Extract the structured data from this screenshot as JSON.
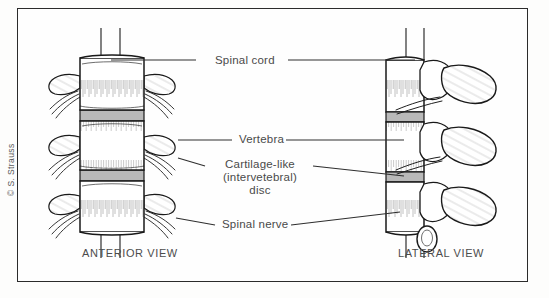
{
  "figure": {
    "credit": "© S. Strauss",
    "frame_color": "#2b2b2b",
    "background_color": "#fefefe",
    "bone_fill": "#ffffff",
    "bone_outline": "#1a1a1a",
    "disc_fill": "#b9b9b9",
    "label_color": "#4a4a4a",
    "leader_color": "#2e2e2e"
  },
  "labels": {
    "spinal_cord": "Spinal cord",
    "vertebra": "Vertebra",
    "disc_line1": "Cartilage-like",
    "disc_line2": "(intervetebral)",
    "disc_line3": "disc",
    "spinal_nerve": "Spinal nerve"
  },
  "views": {
    "anterior": "ANTERIOR VIEW",
    "lateral": "LATERAL VIEW"
  },
  "diagram_parts": [
    {
      "name": "spinal-cord",
      "view": "both",
      "count": 2
    },
    {
      "name": "vertebral-body",
      "view": "anterior",
      "count": 3
    },
    {
      "name": "intervertebral-disc",
      "view": "anterior",
      "count": 2
    },
    {
      "name": "transverse-process",
      "view": "anterior",
      "count": 6
    },
    {
      "name": "spinal-nerve-root",
      "view": "anterior",
      "count": 12
    },
    {
      "name": "vertebral-body",
      "view": "lateral",
      "count": 3
    },
    {
      "name": "intervertebral-disc",
      "view": "lateral",
      "count": 2
    },
    {
      "name": "spinous-process",
      "view": "lateral",
      "count": 3
    },
    {
      "name": "spinal-nerve-root",
      "view": "lateral",
      "count": 4
    }
  ]
}
